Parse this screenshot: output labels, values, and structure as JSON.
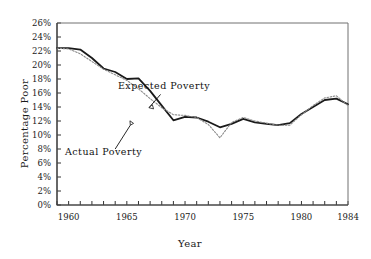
{
  "chart_data": {
    "type": "line",
    "title": "",
    "xlabel": "Year",
    "ylabel": "Percentage Poor",
    "xlim": [
      1959,
      1984
    ],
    "ylim": [
      0,
      26
    ],
    "grid": false,
    "legend": "annotations",
    "y_tick_labels": [
      "0%",
      "2%",
      "4%",
      "6%",
      "8%",
      "10%",
      "12%",
      "14%",
      "16%",
      "18%",
      "20%",
      "22%",
      "24%",
      "26%"
    ],
    "y_tick_values": [
      0,
      2,
      4,
      6,
      8,
      10,
      12,
      14,
      16,
      18,
      20,
      22,
      24,
      26
    ],
    "x_tick_labels": [
      "1960",
      "1965",
      "1970",
      "1975",
      "1980",
      "1984"
    ],
    "x_tick_values": [
      1960,
      1965,
      1970,
      1975,
      1980,
      1984
    ],
    "x_minor_ticks": [
      1959,
      1960,
      1961,
      1962,
      1963,
      1964,
      1965,
      1966,
      1967,
      1968,
      1969,
      1970,
      1971,
      1972,
      1973,
      1974,
      1975,
      1976,
      1977,
      1978,
      1979,
      1980,
      1981,
      1982,
      1983,
      1984
    ],
    "x": [
      1959,
      1960,
      1961,
      1962,
      1963,
      1964,
      1965,
      1966,
      1967,
      1968,
      1969,
      1970,
      1971,
      1972,
      1973,
      1974,
      1975,
      1976,
      1977,
      1978,
      1979,
      1980,
      1981,
      1982,
      1983,
      1984
    ],
    "series": [
      {
        "name": "Actual Poverty",
        "style": "solid",
        "color": "#1a1a1a",
        "values": [
          22.4,
          22.4,
          22.2,
          21.0,
          19.5,
          19.0,
          18.0,
          18.1,
          16.3,
          14.2,
          12.1,
          12.6,
          12.5,
          11.9,
          11.1,
          11.6,
          12.3,
          11.8,
          11.6,
          11.4,
          11.7,
          13.0,
          14.0,
          15.0,
          15.2,
          14.4
        ]
      },
      {
        "name": "Expected Poverty",
        "style": "dotted",
        "color": "#8a8a8a",
        "values": [
          22.4,
          22.3,
          21.6,
          20.5,
          19.4,
          18.6,
          17.8,
          16.6,
          15.2,
          13.9,
          12.9,
          12.8,
          12.5,
          11.5,
          9.6,
          11.8,
          12.5,
          12.0,
          11.7,
          11.4,
          11.4,
          12.9,
          14.2,
          15.3,
          15.6,
          14.2
        ]
      }
    ],
    "annotations": [
      {
        "name": "expected-poverty-label",
        "text": "Expected Poverty",
        "x": 1968.2,
        "y": 16.6
      },
      {
        "name": "actual-poverty-label",
        "text": "Actual Poverty",
        "x": 1963.0,
        "y": 7.2
      }
    ]
  }
}
